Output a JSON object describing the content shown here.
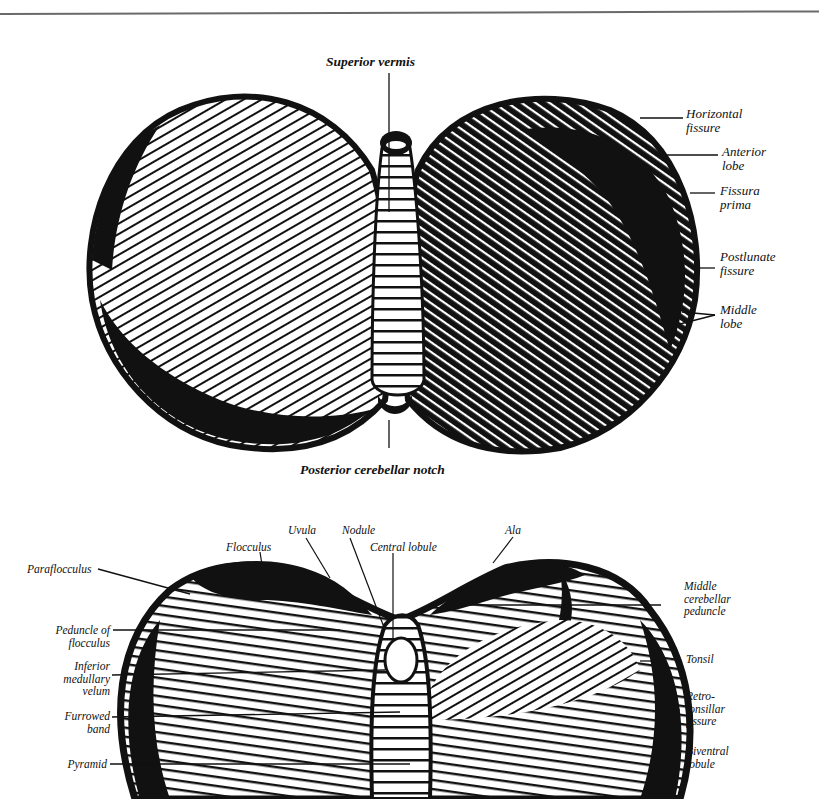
{
  "figure": {
    "colors": {
      "ink": "#111111",
      "paper": "#ffffff",
      "rule": "#6a6a6a"
    },
    "superior_view": {
      "labels": {
        "superior_vermis": "Superior vermis",
        "horizontal_fissure": "Horizontal\nfissure",
        "anterior_lobe": "Anterior\nlobe",
        "fissura_prima": "Fissura\nprima",
        "postlunate_fissure": "Postlunate\nfissure",
        "middle_lobe": "Middle\nlobe",
        "posterior_cerebellar_notch": "Posterior cerebellar notch"
      }
    },
    "inferior_view": {
      "labels": {
        "uvula": "Uvula",
        "nodule": "Nodule",
        "central_lobule": "Central lobule",
        "ala": "Ala",
        "flocculus": "Flocculus",
        "paraflocculus": "Paraflocculus",
        "peduncle_of_flocculus": "Peduncle of\nflocculus",
        "inferior_medullary_velum": "Inferior\nmedullary\nvelum",
        "furrowed_band": "Furrowed\nband",
        "pyramid": "Pyramid",
        "middle_cerebellar_peduncle": "Middle\ncerebellar\npeduncle",
        "tonsil": "Tonsil",
        "retro_tonsillar_fissure": "Retro-\ntonsillar\nfissure",
        "biventral_lobule": "Biventral\nlobule"
      }
    }
  }
}
